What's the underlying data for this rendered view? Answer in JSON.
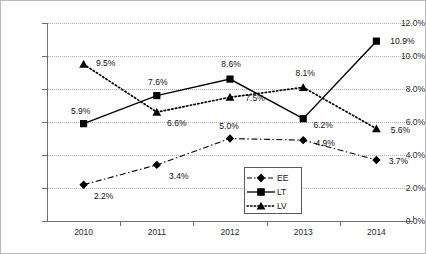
{
  "chart_data": {
    "type": "line",
    "title": "",
    "xlabel": "",
    "ylabel": "",
    "categories": [
      "2010",
      "2011",
      "2012",
      "2013",
      "2014"
    ],
    "ylim": [
      0,
      12
    ],
    "yticks": [
      "0.0%",
      "2.0%",
      "4.0%",
      "6.0%",
      "8.0%",
      "10.0%",
      "12.0%"
    ],
    "ytick_values": [
      0,
      2,
      4,
      6,
      8,
      10,
      12
    ],
    "grid": true,
    "legend_position": "inside-bottom-center",
    "series": [
      {
        "name": "EE",
        "marker": "diamond",
        "line_style": "dash-dot",
        "values": [
          2.2,
          3.4,
          5.0,
          4.9,
          3.7
        ],
        "labels": [
          "2.2%",
          "3.4%",
          "5.0%",
          "4.9%",
          "3.7%"
        ]
      },
      {
        "name": "LT",
        "marker": "square",
        "line_style": "solid",
        "values": [
          5.9,
          7.6,
          8.6,
          6.2,
          10.9
        ],
        "labels": [
          "5.9%",
          "7.6%",
          "8.6%",
          "6.2%",
          "10.9%"
        ]
      },
      {
        "name": "LV",
        "marker": "triangle",
        "line_style": "dotted",
        "values": [
          9.5,
          6.6,
          7.5,
          8.1,
          5.6
        ],
        "labels": [
          "9.5%",
          "6.6%",
          "7.5%",
          "8.1%",
          "5.6%"
        ]
      }
    ],
    "colors": {
      "line": "#000000",
      "grid": "#b0b0b0",
      "axis": "#6e6e6e",
      "text": "#111111",
      "background": "#ffffff",
      "border": "#b9b9b9"
    }
  },
  "legend": {
    "items": [
      {
        "label": "EE"
      },
      {
        "label": "LT"
      },
      {
        "label": "LV"
      }
    ]
  }
}
